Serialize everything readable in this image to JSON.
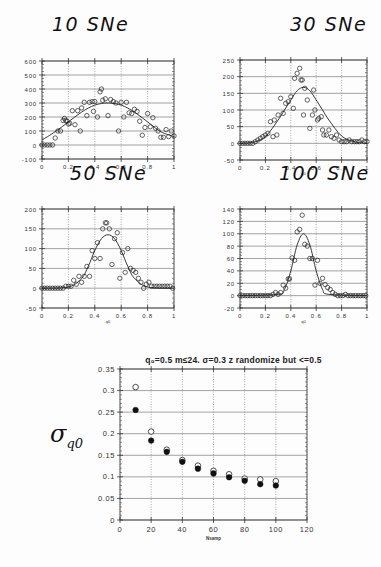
{
  "panels": [
    {
      "id": "p1",
      "title": "10 SNe",
      "title_x": 52,
      "title_y": 14,
      "box": {
        "x0": 42,
        "x1": 174,
        "y0": 61,
        "y1": 159
      },
      "xlim": [
        0,
        1
      ],
      "ylim": [
        -100,
        600
      ],
      "yticks": [
        600,
        500,
        400,
        300,
        200,
        100,
        0,
        -100
      ],
      "xticks": [
        0,
        0.2,
        0.4,
        0.6,
        0.8,
        1
      ],
      "xlabel": "q0"
    },
    {
      "id": "p2",
      "title": "30 SNe",
      "title_x": 290,
      "title_y": 14,
      "box": {
        "x0": 240,
        "x1": 367,
        "y0": 60,
        "y1": 160
      },
      "xlim": [
        0,
        1
      ],
      "ylim": [
        -50,
        250
      ],
      "yticks": [
        250,
        200,
        150,
        100,
        50,
        0,
        -50
      ],
      "xticks": [
        0,
        0.2,
        0.4,
        0.6,
        0.8,
        1
      ],
      "xlabel": "q0"
    },
    {
      "id": "p3",
      "title": "50 SNe",
      "title_x": 70,
      "title_y": 163,
      "box": {
        "x0": 42,
        "x1": 174,
        "y0": 209,
        "y1": 308
      },
      "xlim": [
        0,
        1
      ],
      "ylim": [
        -50,
        200
      ],
      "yticks": [
        200,
        150,
        100,
        50,
        0,
        -50
      ],
      "xticks": [
        0,
        0.2,
        0.4,
        0.6,
        0.8,
        1
      ],
      "xlabel": "q0"
    },
    {
      "id": "p4",
      "title": "100 SNe",
      "title_x": 279,
      "title_y": 163,
      "box": {
        "x0": 240,
        "x1": 367,
        "y0": 209,
        "y1": 308
      },
      "xlim": [
        0,
        1
      ],
      "ylim": [
        -20,
        140
      ],
      "yticks": [
        140,
        120,
        100,
        80,
        60,
        40,
        20,
        0,
        -20
      ],
      "xticks": [
        0,
        0.2,
        0.4,
        0.6,
        0.8,
        1
      ],
      "xlabel": "q0"
    }
  ],
  "bottom": {
    "title": "q₀=0.5  m≤24.  σ=0.3  z  randomize  but  <=0.5",
    "xlabel": "Nsamp",
    "ylabel": "σ",
    "ylabel_sub": "q0",
    "box": {
      "x0": 120,
      "x1": 307,
      "y0": 369,
      "y1": 520
    },
    "xlim": [
      0,
      120
    ],
    "ylim": [
      0,
      0.35
    ],
    "xticks": [
      0,
      20,
      40,
      60,
      80,
      100,
      120
    ],
    "yticks": [
      0.35,
      0.3,
      0.25,
      0.2,
      0.15,
      0.1,
      0.05,
      0
    ]
  },
  "chart_data": [
    {
      "type": "scatter",
      "title": "10 SNe",
      "xlabel": "q0",
      "ylabel": "",
      "xlim": [
        0,
        1
      ],
      "ylim": [
        -100,
        600
      ],
      "grid": true,
      "series": [
        {
          "name": "histogram points",
          "marker": "open-circle",
          "x": [
            0,
            0.02,
            0.04,
            0.06,
            0.08,
            0.1,
            0.12,
            0.14,
            0.16,
            0.17,
            0.18,
            0.19,
            0.2,
            0.21,
            0.23,
            0.25,
            0.27,
            0.29,
            0.3,
            0.32,
            0.34,
            0.36,
            0.38,
            0.39,
            0.4,
            0.42,
            0.44,
            0.45,
            0.46,
            0.48,
            0.5,
            0.52,
            0.54,
            0.56,
            0.58,
            0.6,
            0.62,
            0.64,
            0.66,
            0.68,
            0.7,
            0.72,
            0.74,
            0.76,
            0.78,
            0.8,
            0.82,
            0.84,
            0.86,
            0.88,
            0.9,
            0.92,
            0.94,
            0.96,
            0.98,
            1.0
          ],
          "y": [
            0,
            0,
            0,
            0,
            0,
            50,
            100,
            100,
            175,
            190,
            175,
            170,
            150,
            155,
            245,
            145,
            245,
            100,
            265,
            305,
            210,
            305,
            310,
            240,
            310,
            200,
            380,
            400,
            320,
            330,
            210,
            325,
            310,
            300,
            100,
            305,
            200,
            305,
            230,
            225,
            255,
            240,
            170,
            70,
            125,
            225,
            130,
            195,
            120,
            100,
            55,
            55,
            110,
            60,
            100,
            65
          ]
        },
        {
          "name": "model curve",
          "marker": "line",
          "x": [
            0,
            0.1,
            0.2,
            0.3,
            0.4,
            0.5,
            0.6,
            0.7,
            0.8,
            0.9,
            1.0
          ],
          "y": [
            35,
            95,
            165,
            235,
            285,
            300,
            285,
            235,
            165,
            95,
            60
          ]
        }
      ]
    },
    {
      "type": "scatter",
      "title": "30 SNe",
      "xlabel": "q0",
      "ylabel": "",
      "xlim": [
        0,
        1
      ],
      "ylim": [
        -50,
        250
      ],
      "grid": true,
      "series": [
        {
          "name": "histogram points",
          "marker": "open-circle",
          "x": [
            0,
            0.02,
            0.04,
            0.06,
            0.08,
            0.1,
            0.12,
            0.14,
            0.16,
            0.18,
            0.2,
            0.22,
            0.24,
            0.26,
            0.27,
            0.29,
            0.3,
            0.32,
            0.34,
            0.36,
            0.38,
            0.4,
            0.42,
            0.43,
            0.45,
            0.47,
            0.48,
            0.49,
            0.5,
            0.51,
            0.53,
            0.55,
            0.57,
            0.58,
            0.59,
            0.61,
            0.62,
            0.64,
            0.65,
            0.66,
            0.68,
            0.7,
            0.72,
            0.74,
            0.76,
            0.78,
            0.8,
            0.82,
            0.84,
            0.86,
            0.88,
            0.9,
            0.92,
            0.94,
            0.96,
            0.98,
            1.0
          ],
          "y": [
            0,
            0,
            0,
            0,
            0,
            0,
            5,
            10,
            15,
            20,
            25,
            30,
            65,
            20,
            70,
            25,
            85,
            135,
            90,
            120,
            125,
            140,
            105,
            195,
            210,
            225,
            190,
            190,
            85,
            165,
            130,
            45,
            85,
            160,
            100,
            70,
            75,
            80,
            40,
            25,
            25,
            40,
            20,
            15,
            25,
            10,
            5,
            5,
            5,
            10,
            5,
            5,
            5,
            5,
            10,
            5,
            5
          ]
        },
        {
          "name": "model curve",
          "marker": "line",
          "x": [
            0,
            0.1,
            0.2,
            0.3,
            0.35,
            0.4,
            0.45,
            0.5,
            0.55,
            0.6,
            0.65,
            0.7,
            0.8,
            0.9,
            1.0
          ],
          "y": [
            0,
            3,
            20,
            70,
            100,
            130,
            158,
            168,
            158,
            130,
            100,
            70,
            22,
            5,
            0
          ]
        }
      ]
    },
    {
      "type": "scatter",
      "title": "50 SNe",
      "xlabel": "q0",
      "ylabel": "",
      "xlim": [
        0,
        1
      ],
      "ylim": [
        -50,
        200
      ],
      "grid": true,
      "series": [
        {
          "name": "histogram points",
          "marker": "open-circle",
          "x": [
            0,
            0.02,
            0.04,
            0.06,
            0.08,
            0.1,
            0.12,
            0.14,
            0.16,
            0.18,
            0.2,
            0.22,
            0.24,
            0.26,
            0.28,
            0.3,
            0.32,
            0.34,
            0.36,
            0.38,
            0.4,
            0.42,
            0.44,
            0.46,
            0.48,
            0.49,
            0.51,
            0.53,
            0.55,
            0.57,
            0.59,
            0.61,
            0.63,
            0.65,
            0.67,
            0.69,
            0.71,
            0.73,
            0.75,
            0.77,
            0.79,
            0.81,
            0.83,
            0.85,
            0.87,
            0.89,
            0.91,
            0.93,
            0.95,
            0.97,
            0.99
          ],
          "y": [
            0,
            0,
            0,
            0,
            0,
            0,
            0,
            0,
            0,
            5,
            5,
            5,
            20,
            10,
            30,
            15,
            30,
            55,
            30,
            95,
            75,
            115,
            75,
            150,
            165,
            165,
            150,
            60,
            125,
            140,
            25,
            90,
            40,
            100,
            50,
            45,
            40,
            25,
            15,
            0,
            10,
            15,
            5,
            5,
            5,
            5,
            5,
            5,
            5,
            5,
            0
          ]
        },
        {
          "name": "model curve",
          "marker": "line",
          "x": [
            0,
            0.2,
            0.3,
            0.35,
            0.4,
            0.45,
            0.5,
            0.55,
            0.6,
            0.65,
            0.7,
            0.8,
            1.0
          ],
          "y": [
            0,
            3,
            25,
            55,
            95,
            125,
            135,
            125,
            95,
            55,
            25,
            3,
            0
          ]
        }
      ]
    },
    {
      "type": "scatter",
      "title": "100 SNe",
      "xlabel": "q0",
      "ylabel": "",
      "xlim": [
        0,
        1
      ],
      "ylim": [
        -20,
        140
      ],
      "grid": true,
      "series": [
        {
          "name": "histogram points",
          "marker": "open-circle",
          "x": [
            0,
            0.02,
            0.04,
            0.06,
            0.08,
            0.1,
            0.12,
            0.14,
            0.16,
            0.18,
            0.2,
            0.22,
            0.24,
            0.26,
            0.28,
            0.3,
            0.32,
            0.34,
            0.36,
            0.38,
            0.39,
            0.41,
            0.43,
            0.45,
            0.47,
            0.49,
            0.51,
            0.53,
            0.55,
            0.57,
            0.59,
            0.61,
            0.63,
            0.65,
            0.67,
            0.69,
            0.71,
            0.73,
            0.75,
            0.77,
            0.79,
            0.81,
            0.83,
            0.85,
            0.87,
            0.89,
            0.91,
            0.93,
            0.95,
            0.97,
            0.99
          ],
          "y": [
            0,
            0,
            0,
            0,
            0,
            0,
            0,
            0,
            0,
            0,
            0,
            0,
            0,
            2,
            5,
            2,
            5,
            17,
            12,
            27,
            27,
            61,
            57,
            103,
            107,
            130,
            83,
            80,
            60,
            60,
            17,
            57,
            20,
            28,
            18,
            13,
            10,
            5,
            2,
            0,
            0,
            0,
            2,
            0,
            0,
            0,
            0,
            0,
            0,
            0,
            0
          ]
        },
        {
          "name": "model curve",
          "marker": "line",
          "x": [
            0,
            0.3,
            0.35,
            0.4,
            0.45,
            0.5,
            0.55,
            0.6,
            0.65,
            0.7,
            1.0
          ],
          "y": [
            0,
            2,
            10,
            40,
            82,
            100,
            82,
            40,
            10,
            2,
            0
          ]
        }
      ]
    },
    {
      "type": "scatter",
      "title": "q0=0.5  m<=24.  sigma=0.3  z  randomize  but  <=0.5",
      "xlabel": "Nsamp",
      "ylabel": "sigma_q0",
      "xlim": [
        0,
        120
      ],
      "ylim": [
        0,
        0.35
      ],
      "grid": true,
      "x": [
        10,
        20,
        30,
        40,
        50,
        60,
        70,
        80,
        90,
        100
      ],
      "series": [
        {
          "name": "open circles",
          "marker": "open-circle",
          "values": [
            0.308,
            0.205,
            0.163,
            0.139,
            0.126,
            0.114,
            0.106,
            0.096,
            0.094,
            0.09
          ]
        },
        {
          "name": "filled circles",
          "marker": "filled-circle",
          "values": [
            0.255,
            0.184,
            0.158,
            0.135,
            0.119,
            0.108,
            0.099,
            0.091,
            0.083,
            0.08
          ]
        }
      ]
    }
  ]
}
